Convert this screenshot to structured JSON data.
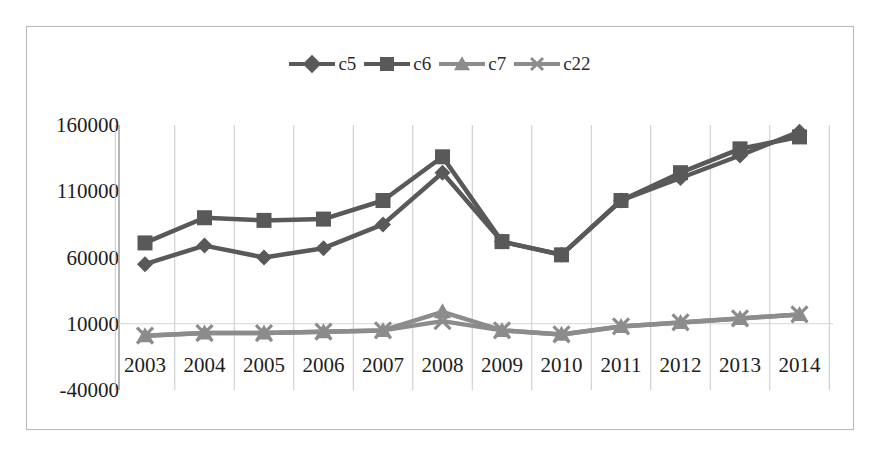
{
  "chart_data": {
    "type": "line",
    "title": "",
    "xlabel": "",
    "ylabel": "",
    "categories": [
      "2003",
      "2004",
      "2005",
      "2006",
      "2007",
      "2008",
      "2009",
      "2010",
      "2011",
      "2012",
      "2013",
      "2014"
    ],
    "ylim": [
      -40000,
      160000
    ],
    "ytick_labels": [
      "160000",
      "110000",
      "60000",
      "10000",
      "-40000"
    ],
    "ytick_values": [
      160000,
      110000,
      60000,
      10000,
      -40000
    ],
    "grid": "vertical",
    "legend_position": "top-center",
    "series": [
      {
        "name": "c5",
        "marker": "diamond",
        "color": "#595959",
        "values": [
          55000,
          69000,
          60000,
          67000,
          85000,
          124000,
          72000,
          62000,
          103000,
          120000,
          137000,
          155000
        ]
      },
      {
        "name": "c6",
        "marker": "square",
        "color": "#595959",
        "values": [
          71000,
          90000,
          88000,
          89000,
          103000,
          136000,
          72000,
          62000,
          103000,
          124000,
          142000,
          151000
        ]
      },
      {
        "name": "c7",
        "marker": "triangle",
        "color": "#8c8c8c",
        "values": [
          1000,
          3000,
          3000,
          4000,
          5000,
          19000,
          5000,
          2000,
          8000,
          11000,
          14000,
          17000
        ]
      },
      {
        "name": "c22",
        "marker": "x",
        "color": "#8c8c8c",
        "values": [
          1000,
          3000,
          3000,
          4000,
          5000,
          12000,
          5000,
          2000,
          8000,
          11000,
          14000,
          17000
        ]
      }
    ]
  },
  "legend": {
    "items": [
      {
        "label": "c5",
        "marker": "diamond",
        "color": "#595959"
      },
      {
        "label": "c6",
        "marker": "square",
        "color": "#595959"
      },
      {
        "label": "c7",
        "marker": "triangle",
        "color": "#8c8c8c"
      },
      {
        "label": "c22",
        "marker": "x",
        "color": "#8c8c8c"
      }
    ]
  },
  "colors": {
    "frame_border": "#b9b9b9",
    "gridline": "#c8c8c8",
    "axis": "#9e9e9e",
    "text": "#1d1d1d",
    "series_dark": "#595959",
    "series_light": "#8c8c8c",
    "background": "#ffffff"
  }
}
